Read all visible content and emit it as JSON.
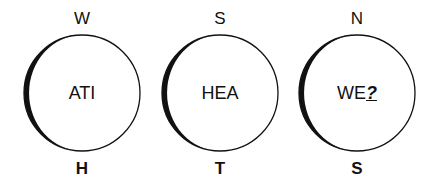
{
  "puzzles": [
    {
      "top": "W",
      "center": "ATI",
      "bottom": "H"
    },
    {
      "top": "S",
      "center": "HEA",
      "bottom": "T"
    },
    {
      "top": "N",
      "center": "WE",
      "center_missing": "?",
      "bottom": "S"
    }
  ],
  "colors": {
    "stroke": "#111111",
    "background": "#ffffff"
  }
}
